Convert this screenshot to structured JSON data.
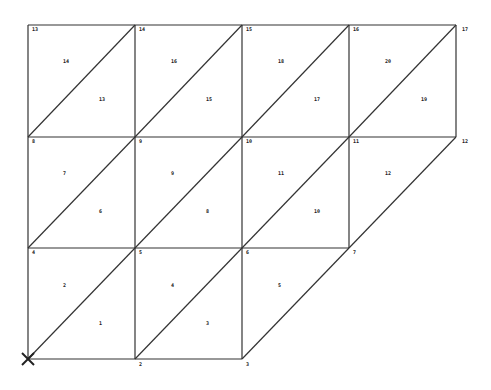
{
  "diagram": {
    "type": "triangular-mesh",
    "line_color": "#333333",
    "background": "#ffffff",
    "origin_marker": "cross-icon",
    "nodes": [
      {
        "id": "1",
        "x": 28,
        "y": 359
      },
      {
        "id": "2",
        "x": 135,
        "y": 359
      },
      {
        "id": "3",
        "x": 242,
        "y": 359
      },
      {
        "id": "4",
        "x": 28,
        "y": 248
      },
      {
        "id": "5",
        "x": 135,
        "y": 248
      },
      {
        "id": "6",
        "x": 242,
        "y": 248
      },
      {
        "id": "7",
        "x": 349,
        "y": 248
      },
      {
        "id": "8",
        "x": 28,
        "y": 137
      },
      {
        "id": "9",
        "x": 135,
        "y": 137
      },
      {
        "id": "10",
        "x": 242,
        "y": 137
      },
      {
        "id": "11",
        "x": 349,
        "y": 137
      },
      {
        "id": "12",
        "x": 456,
        "y": 137
      },
      {
        "id": "13",
        "x": 28,
        "y": 25
      },
      {
        "id": "14",
        "x": 135,
        "y": 25
      },
      {
        "id": "15",
        "x": 242,
        "y": 25
      },
      {
        "id": "16",
        "x": 349,
        "y": 25
      },
      {
        "id": "17",
        "x": 456,
        "y": 25
      }
    ],
    "node_labels": [
      {
        "text": "",
        "x": 30,
        "y": 368
      },
      {
        "text": "2",
        "x": 139,
        "y": 366
      },
      {
        "text": "3",
        "x": 246,
        "y": 366
      },
      {
        "text": "4",
        "x": 32,
        "y": 254
      },
      {
        "text": "5",
        "x": 139,
        "y": 254
      },
      {
        "text": "6",
        "x": 246,
        "y": 254
      },
      {
        "text": "7",
        "x": 353,
        "y": 254
      },
      {
        "text": "8",
        "x": 32,
        "y": 143
      },
      {
        "text": "9",
        "x": 139,
        "y": 143
      },
      {
        "text": "10",
        "x": 246,
        "y": 143
      },
      {
        "text": "11",
        "x": 353,
        "y": 143
      },
      {
        "text": "12",
        "x": 462,
        "y": 143
      },
      {
        "text": "13",
        "x": 32,
        "y": 31
      },
      {
        "text": "14",
        "x": 139,
        "y": 31
      },
      {
        "text": "15",
        "x": 246,
        "y": 31
      },
      {
        "text": "16",
        "x": 353,
        "y": 31
      },
      {
        "text": "17",
        "x": 462,
        "y": 31
      }
    ],
    "elements": [
      {
        "id": "1",
        "nodes": [
          "1",
          "2",
          "5"
        ],
        "label_x": 99,
        "label_y": 325
      },
      {
        "id": "2",
        "nodes": [
          "1",
          "5",
          "4"
        ],
        "label_x": 63,
        "label_y": 287
      },
      {
        "id": "3",
        "nodes": [
          "2",
          "3",
          "6"
        ],
        "label_x": 206,
        "label_y": 325
      },
      {
        "id": "4",
        "nodes": [
          "2",
          "6",
          "5"
        ],
        "label_x": 171,
        "label_y": 287
      },
      {
        "id": "5",
        "nodes": [
          "3",
          "7",
          "6"
        ],
        "label_x": 278,
        "label_y": 287
      },
      {
        "id": "6",
        "nodes": [
          "4",
          "5",
          "9"
        ],
        "label_x": 99,
        "label_y": 213
      },
      {
        "id": "7",
        "nodes": [
          "4",
          "9",
          "8"
        ],
        "label_x": 63,
        "label_y": 175
      },
      {
        "id": "8",
        "nodes": [
          "5",
          "6",
          "10"
        ],
        "label_x": 206,
        "label_y": 213
      },
      {
        "id": "9",
        "nodes": [
          "5",
          "10",
          "9"
        ],
        "label_x": 171,
        "label_y": 175
      },
      {
        "id": "10",
        "nodes": [
          "6",
          "7",
          "11"
        ],
        "label_x": 314,
        "label_y": 213
      },
      {
        "id": "11",
        "nodes": [
          "6",
          "11",
          "10"
        ],
        "label_x": 278,
        "label_y": 175
      },
      {
        "id": "12",
        "nodes": [
          "7",
          "12",
          "11"
        ],
        "label_x": 385,
        "label_y": 175
      },
      {
        "id": "13",
        "nodes": [
          "8",
          "9",
          "14"
        ],
        "label_x": 99,
        "label_y": 101
      },
      {
        "id": "14",
        "nodes": [
          "8",
          "14",
          "13"
        ],
        "label_x": 63,
        "label_y": 63
      },
      {
        "id": "15",
        "nodes": [
          "9",
          "10",
          "15"
        ],
        "label_x": 206,
        "label_y": 101
      },
      {
        "id": "16",
        "nodes": [
          "9",
          "15",
          "14"
        ],
        "label_x": 171,
        "label_y": 63
      },
      {
        "id": "17",
        "nodes": [
          "10",
          "11",
          "16"
        ],
        "label_x": 314,
        "label_y": 101
      },
      {
        "id": "18",
        "nodes": [
          "10",
          "16",
          "15"
        ],
        "label_x": 278,
        "label_y": 63
      },
      {
        "id": "19",
        "nodes": [
          "11",
          "12",
          "17"
        ],
        "label_x": 421,
        "label_y": 101
      },
      {
        "id": "20",
        "nodes": [
          "11",
          "17",
          "16"
        ],
        "label_x": 385,
        "label_y": 63
      }
    ]
  }
}
